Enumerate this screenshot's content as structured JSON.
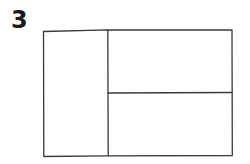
{
  "figure": {
    "number_label": "3",
    "stroke_color": "#3a3a3a",
    "layout": {
      "outer": {
        "x1": 43,
        "y1": 31,
        "x2": 232,
        "y2": 156
      },
      "vertical_divider_x": 108,
      "horizontal_divider_y": 93
    },
    "panels": [
      {
        "name": "left-panel",
        "region": "left full-height column"
      },
      {
        "name": "top-right-panel",
        "region": "upper right cell"
      },
      {
        "name": "bottom-right-panel",
        "region": "lower right cell"
      }
    ]
  }
}
